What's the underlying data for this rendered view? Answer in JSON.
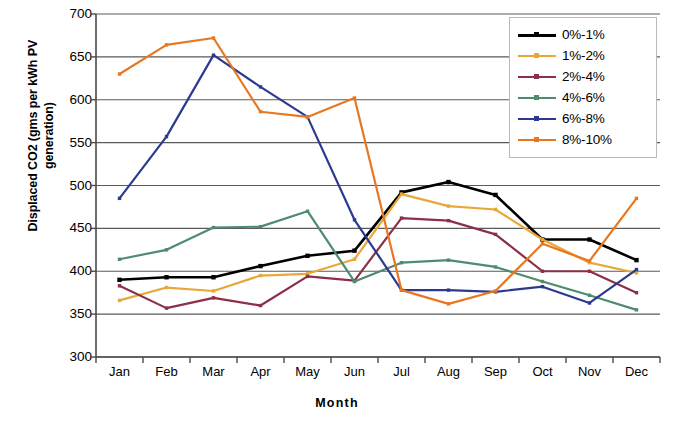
{
  "chart_data": {
    "type": "line",
    "title": "",
    "xlabel": "Month",
    "ylabel": "Displaced CO2 (gms per kWh PV generation)",
    "categories": [
      "Jan",
      "Feb",
      "Mar",
      "Apr",
      "May",
      "Jun",
      "Jul",
      "Aug",
      "Sep",
      "Oct",
      "Nov",
      "Dec"
    ],
    "ylim": [
      300,
      700
    ],
    "yticks": [
      700,
      650,
      600,
      550,
      500,
      450,
      400,
      350,
      300
    ],
    "grid": true,
    "legend_position": "top-right",
    "series": [
      {
        "name": "0%-1%",
        "color": "#000000",
        "markers": true,
        "values": [
          390,
          393,
          393,
          406,
          418,
          424,
          492,
          504,
          489,
          437,
          437,
          413
        ]
      },
      {
        "name": "1%-2%",
        "color": "#E8A838",
        "markers": true,
        "values": [
          366,
          381,
          377,
          395,
          397,
          414,
          490,
          476,
          472,
          437,
          410,
          398
        ]
      },
      {
        "name": "2%-4%",
        "color": "#8B2F4A",
        "markers": true,
        "values": [
          383,
          357,
          369,
          360,
          394,
          389,
          462,
          459,
          443,
          400,
          400,
          375
        ]
      },
      {
        "name": "4%-6%",
        "color": "#4E8B6F",
        "markers": true,
        "values": [
          414,
          425,
          451,
          452,
          470,
          388,
          410,
          413,
          405,
          388,
          372,
          355
        ]
      },
      {
        "name": "6%-8%",
        "color": "#2B3A8F",
        "markers": true,
        "values": [
          485,
          557,
          652,
          615,
          580,
          460,
          378,
          378,
          376,
          382,
          363,
          402
        ]
      },
      {
        "name": "8%-10%",
        "color": "#E87722",
        "markers": true,
        "values": [
          630,
          664,
          672,
          586,
          580,
          602,
          378,
          362,
          377,
          432,
          412,
          485
        ]
      }
    ]
  },
  "axes": {
    "y_tick_labels": [
      "700",
      "650",
      "600",
      "550",
      "500",
      "450",
      "400",
      "350",
      "300"
    ],
    "x_tick_labels": [
      "Jan",
      "Feb",
      "Mar",
      "Apr",
      "May",
      "Jun",
      "Jul",
      "Aug",
      "Sep",
      "Oct",
      "Nov",
      "Dec"
    ],
    "y_axis_title": "Displaced CO2 (gms per kWh PV generation)",
    "x_axis_title": "Month"
  },
  "legend": {
    "items": [
      {
        "label": "0%-1%"
      },
      {
        "label": "1%-2%"
      },
      {
        "label": "2%-4%"
      },
      {
        "label": "4%-6%"
      },
      {
        "label": "6%-8%"
      },
      {
        "label": "8%-10%"
      }
    ]
  },
  "style": {
    "gridline_color": "#5a5a5a",
    "axis_color": "#4a4a4a",
    "plot_background": "#ffffff"
  }
}
